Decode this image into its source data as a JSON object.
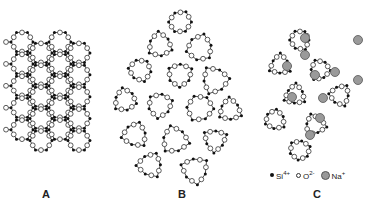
{
  "figure": {
    "panels": [
      {
        "id": "A",
        "label": "A",
        "structure": "crystalline-silica-hexagonal-lattice"
      },
      {
        "id": "B",
        "label": "B",
        "structure": "amorphous-silica-glass-network"
      },
      {
        "id": "C",
        "label": "C",
        "structure": "soda-silicate-glass-network-with-na-ions"
      }
    ],
    "legend": {
      "items": [
        {
          "symbol": "filled-small-dot",
          "label": "Si",
          "charge": "4+"
        },
        {
          "symbol": "open-circle",
          "label": "O",
          "charge": "2-"
        },
        {
          "symbol": "gray-large-circle",
          "label": "Na",
          "charge": "+"
        }
      ]
    },
    "colors": {
      "background": "#ffffff",
      "si": "#111111",
      "o_stroke": "#333333",
      "o_fill": "#ffffff",
      "na_fill": "#9a9a9a",
      "na_stroke": "#555555",
      "bond": "#222222"
    }
  }
}
